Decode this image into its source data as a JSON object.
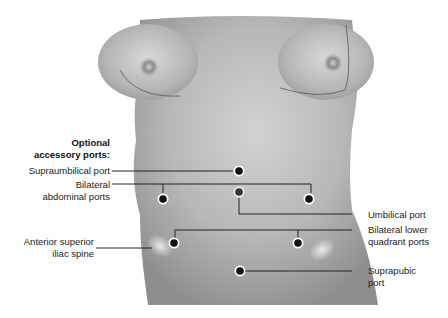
{
  "diagram": {
    "header_label": {
      "line1": "Optional",
      "line2": "accessory ports:"
    },
    "labels": {
      "supraumbilical": "Supraumbilical port",
      "bilateral_abdominal": {
        "line1": "Bilateral",
        "line2": "abdominal ports"
      },
      "asis": {
        "line1": "Anterior superior",
        "line2": "iliac spine"
      },
      "umbilical": "Umbilical port",
      "bilateral_lower": {
        "line1": "Bilateral lower",
        "line2": "quadrant ports"
      },
      "suprapubic": {
        "line1": "Suprapubic",
        "line2": "port"
      }
    },
    "ports": [
      {
        "name": "supraumbilical",
        "x": 239,
        "y": 171
      },
      {
        "name": "abdominal-left",
        "x": 163,
        "y": 199
      },
      {
        "name": "umbilical",
        "x": 239,
        "y": 192
      },
      {
        "name": "abdominal-right",
        "x": 309,
        "y": 199
      },
      {
        "name": "lower-quadrant-left",
        "x": 174,
        "y": 243
      },
      {
        "name": "lower-quadrant-right",
        "x": 298,
        "y": 243
      },
      {
        "name": "suprapubic",
        "x": 240,
        "y": 271
      }
    ],
    "colors": {
      "skin_base": "#a9a9a9",
      "skin_light": "#d6d6d6",
      "line": "#222222",
      "port": "#111111",
      "port_ring": "#ffffff"
    }
  }
}
